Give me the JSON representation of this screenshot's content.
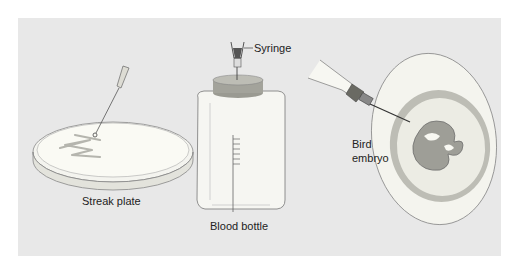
{
  "figure": {
    "background_color": "#e8e8e8",
    "panels": [
      {
        "id": "streak-plate",
        "label": "Streak plate"
      },
      {
        "id": "blood-bottle",
        "label": "Blood bottle",
        "callout": "Syringe"
      },
      {
        "id": "bird-embryo",
        "label_line1": "Bird",
        "label_line2": "embryo"
      }
    ]
  }
}
